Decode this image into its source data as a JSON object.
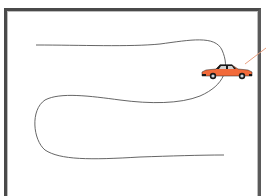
{
  "diagram": {
    "colors": {
      "frame": "#4a4a4a",
      "path": "#555555",
      "car_body": "#f26a3a",
      "car_roof": "#1a1a1a",
      "pointer_line": "#e8a080"
    },
    "elements": {
      "path": "winding-path",
      "vehicle": "car",
      "pointer": "leader-line"
    }
  }
}
